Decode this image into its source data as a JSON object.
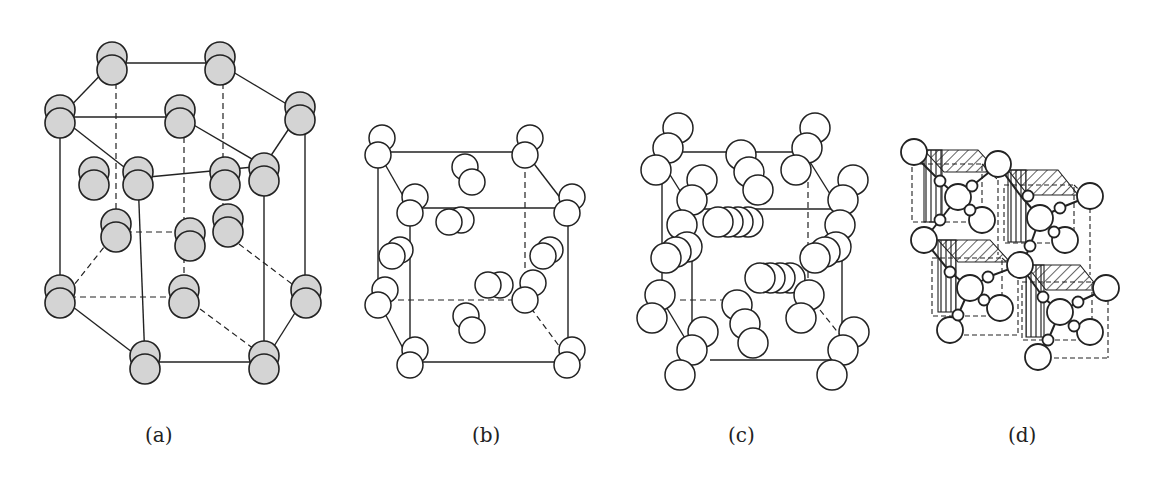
{
  "figure": {
    "panels": [
      {
        "id": "a",
        "label": "(a)",
        "description": "Hexagonal prism lattice with shaded double-sphere molecules at vertices, face centers and interior"
      },
      {
        "id": "b",
        "label": "(b)",
        "description": "Cubic cell with diatomic molecules (pairs of open circles) at corners and face centers"
      },
      {
        "id": "c",
        "label": "(c)",
        "description": "Cubic cell with chain molecules (rows of open circles) at corners and face centers"
      },
      {
        "id": "d",
        "label": "(d)",
        "description": "Diamond-like lattice of large and small spheres with hatched sub-cubes"
      }
    ]
  },
  "colors": {
    "background": "#ffffff",
    "line": "#222222",
    "atom_fill_a": "#d4d4d4",
    "atom_fill_open": "#ffffff"
  }
}
